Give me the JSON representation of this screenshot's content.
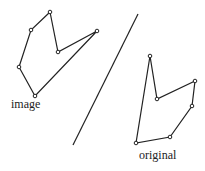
{
  "labels": {
    "image": "image",
    "original": "original"
  },
  "colors": {
    "stroke": "#222222",
    "background": "#ffffff"
  },
  "mirror_line": {
    "x1": 138,
    "y1": 14,
    "x2": 73,
    "y2": 145
  },
  "image_polygon": [
    [
      50,
      12
    ],
    [
      58,
      52
    ],
    [
      97,
      31
    ],
    [
      35,
      96
    ],
    [
      19,
      67
    ],
    [
      31,
      30
    ]
  ],
  "original_polygon": [
    [
      150,
      56
    ],
    [
      157,
      99
    ],
    [
      195,
      81
    ],
    [
      192,
      106
    ],
    [
      170,
      137
    ],
    [
      136,
      143
    ]
  ]
}
